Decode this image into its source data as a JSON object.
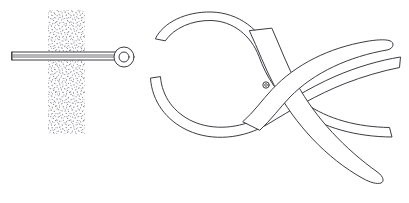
{
  "figure": {
    "title": "Surgical instrument line drawing",
    "background_color": "#ffffff",
    "ink_color": "#3c3c43",
    "stipple_color": "#8a8a90",
    "canvas": {
      "width": 409,
      "height": 203
    }
  },
  "parts": {
    "tissue_band": {
      "name": "stippled tissue cross-section",
      "x": 48,
      "y": 10,
      "width": 37,
      "height": 124,
      "fill_style": "stipple"
    },
    "needle_rod": {
      "name": "eyed needle shaft",
      "start_x": 12,
      "start_y": 56,
      "end_x": 116,
      "end_y": 57,
      "thickness": 8
    },
    "needle_eye": {
      "name": "needle eye ring",
      "center_x": 124,
      "center_y": 57,
      "outer_radius": 10,
      "inner_radius": 5
    },
    "upper_jaw": {
      "name": "upper curved clamp arm",
      "tip_x": 155,
      "tip_y": 38,
      "end_x": 391,
      "end_y": 55
    },
    "lower_jaw": {
      "name": "lower curved clamp arm",
      "tip_x": 150,
      "tip_y": 78,
      "end_x": 381,
      "end_y": 183
    },
    "pivot": {
      "name": "clamp pivot hinge",
      "center_x": 266,
      "center_y": 85,
      "radius": 3.2
    }
  }
}
